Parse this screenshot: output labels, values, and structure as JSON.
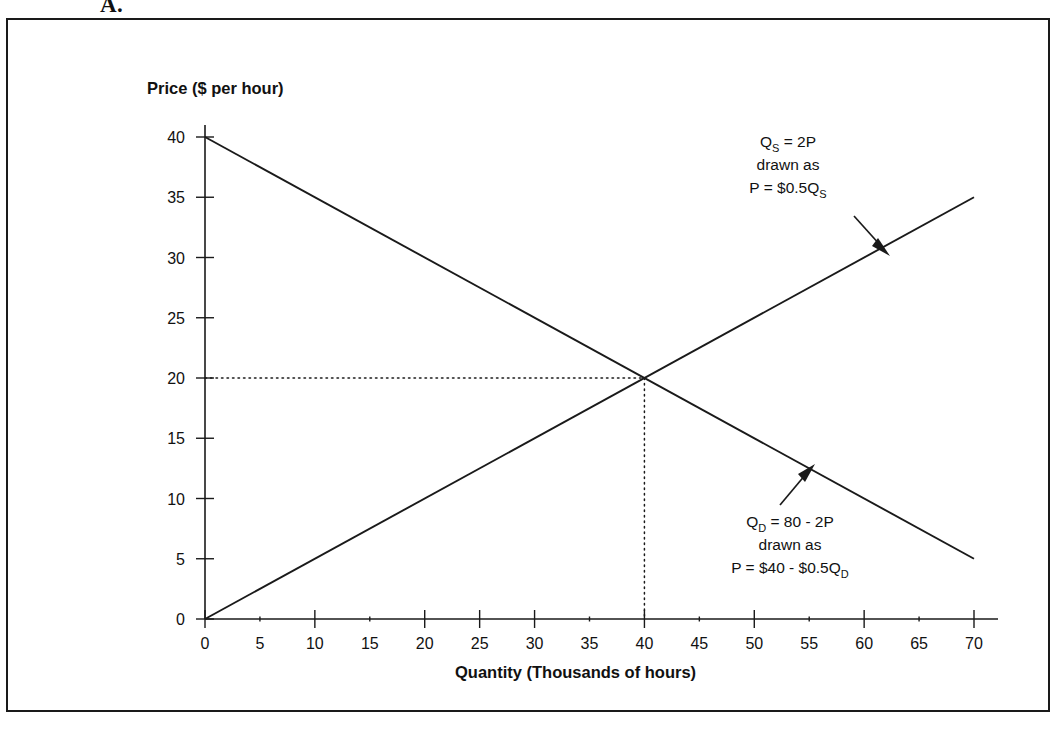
{
  "figure": {
    "part_label": "A."
  },
  "chart_data": {
    "type": "line",
    "title": "",
    "xlabel": "Quantity (Thousands of hours)",
    "ylabel": "Price ($ per hour)",
    "xlim": [
      0,
      70
    ],
    "ylim": [
      0,
      40
    ],
    "grid": false,
    "legend": "none",
    "x_ticks": [
      0,
      5,
      10,
      15,
      20,
      25,
      30,
      35,
      40,
      45,
      50,
      55,
      60,
      65,
      70
    ],
    "x_tick_labels": [
      "0",
      "5",
      "10",
      "15",
      "20",
      "25",
      "30",
      "35",
      "40",
      "45",
      "50",
      "55",
      "60",
      "65",
      "70"
    ],
    "x_major_ticks": [
      0,
      10,
      20,
      25,
      30,
      40,
      50,
      60,
      70
    ],
    "y_ticks": [
      0,
      5,
      10,
      15,
      20,
      25,
      30,
      35,
      40
    ],
    "y_tick_labels": [
      "0",
      "5",
      "10",
      "15",
      "20",
      "25",
      "30",
      "35",
      "40"
    ],
    "series": [
      {
        "name": "Demand",
        "equation": "P = $40 - $0.5Q_D",
        "points": [
          [
            0,
            40
          ],
          [
            70,
            5
          ]
        ]
      },
      {
        "name": "Supply",
        "equation": "P = $0.5Q_S",
        "points": [
          [
            0,
            0
          ],
          [
            70,
            35
          ]
        ]
      }
    ],
    "equilibrium": {
      "quantity": 40,
      "price": 20,
      "guide_lines": "dotted"
    },
    "annotations": [
      {
        "id": "supply-annotation",
        "lines": [
          {
            "pre": "Q",
            "sub": "S",
            "post": " = 2P"
          },
          {
            "pre": "drawn as",
            "sub": "",
            "post": ""
          },
          {
            "pre": "P = $0.5Q",
            "sub": "S",
            "post": ""
          }
        ],
        "arrow": "down-right"
      },
      {
        "id": "demand-annotation",
        "lines": [
          {
            "pre": "Q",
            "sub": "D",
            "post": " = 80 - 2P"
          },
          {
            "pre": "drawn as",
            "sub": "",
            "post": ""
          },
          {
            "pre": "P = $40 - $0.5Q",
            "sub": "D",
            "post": ""
          }
        ],
        "arrow": "up-right"
      }
    ],
    "colors": {
      "line": "#1a1a1a",
      "axis": "#1a1a1a",
      "text": "#111111",
      "background": "#ffffff"
    }
  }
}
